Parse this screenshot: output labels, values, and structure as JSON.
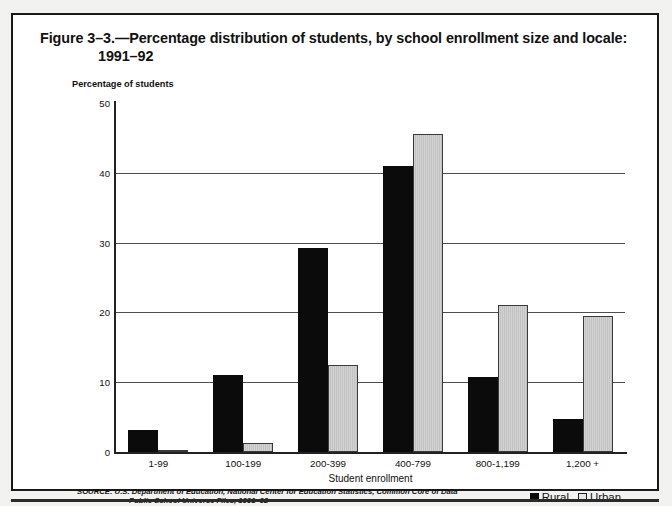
{
  "figure": {
    "title_line1": "Figure 3–3.—Percentage distribution of students, by school enrollment size and locale:",
    "title_line2": "1991–92",
    "source_line1": "SOURCE: U.S. Department of Education, National Center for Education Statistics, Common Core of Data",
    "source_line2": "Public School Universe Files, 1991–92"
  },
  "chart_data": {
    "type": "bar",
    "title": "Figure 3–3.—Percentage distribution of students, by school enrollment size and locale: 1991–92",
    "xlabel": "Student enrollment",
    "ylabel": "Percentage of students",
    "categories": [
      "1-99",
      "100-199",
      "200-399",
      "400-799",
      "800-1,199",
      "1,200 +"
    ],
    "series": [
      {
        "name": "Rural",
        "color": "#0b0b0b",
        "values": [
          3.1,
          11.0,
          29.3,
          41.0,
          10.8,
          4.8
        ]
      },
      {
        "name": "Urban",
        "color": "#d2d2d2",
        "values": [
          0.2,
          1.3,
          12.5,
          45.5,
          21.0,
          19.5
        ]
      }
    ],
    "ylim": [
      0,
      50
    ],
    "yticks": [
      0,
      10,
      20,
      30,
      40,
      50
    ],
    "gridlines": [
      10,
      20,
      30,
      40
    ],
    "grid": true,
    "legend_position": "bottom-right"
  }
}
